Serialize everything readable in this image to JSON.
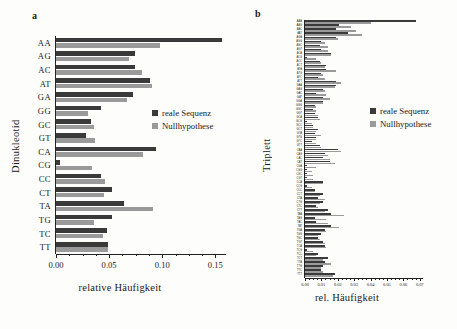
{
  "figure": {
    "legend_labels": {
      "real": "reale Sequenz",
      "null": "Nullhypothese"
    },
    "colors": {
      "real": "#3a3a3a",
      "null": "#9a9a9a",
      "axis": "#222222",
      "background": "#fdfdfb"
    }
  },
  "panel_a": {
    "letter": "a",
    "ylabel": "Dinukleotid",
    "xlabel": "relative Häufigkeit"
  },
  "panel_b": {
    "letter": "b",
    "ylabel": "Triplett",
    "xlabel": "rel. Häufigkeit"
  },
  "chart_data": [
    {
      "type": "bar",
      "orientation": "horizontal",
      "panel": "a",
      "title": "",
      "xlabel": "relative Häufigkeit",
      "ylabel": "Dinukleotid",
      "xlim": [
        0.0,
        0.16
      ],
      "xticks": [
        0.0,
        0.05,
        0.1,
        0.15
      ],
      "xticklabels": [
        "0.00",
        "0.05",
        "0.10",
        "0.15"
      ],
      "grid": false,
      "legend_position": "center-right",
      "categories": [
        "AA",
        "AG",
        "AC",
        "AT",
        "GA",
        "GG",
        "GC",
        "GT",
        "CA",
        "CG",
        "CC",
        "CT",
        "TA",
        "TG",
        "TC",
        "TT"
      ],
      "series": [
        {
          "name": "reale Sequenz",
          "color": "#3a3a3a",
          "values": [
            0.156,
            0.074,
            0.074,
            0.088,
            0.072,
            0.042,
            0.033,
            0.028,
            0.094,
            0.004,
            0.042,
            0.053,
            0.064,
            0.053,
            0.048,
            0.049
          ]
        },
        {
          "name": "Nullhypothese",
          "color": "#9a9a9a",
          "values": [
            0.098,
            0.069,
            0.081,
            0.09,
            0.067,
            0.03,
            0.036,
            0.037,
            0.082,
            0.034,
            0.046,
            0.045,
            0.091,
            0.036,
            0.044,
            0.049
          ]
        }
      ]
    },
    {
      "type": "bar",
      "orientation": "horizontal",
      "panel": "b",
      "title": "",
      "xlabel": "rel. Häufigkeit",
      "ylabel": "Triplett",
      "xlim": [
        0.0,
        0.072
      ],
      "xticks": [
        0.0,
        0.01,
        0.02,
        0.03,
        0.04,
        0.05,
        0.06,
        0.07
      ],
      "xticklabels": [
        "0.00",
        "0.01",
        "0.02",
        "0.03",
        "0.04",
        "0.05",
        "0.06",
        "0.07"
      ],
      "grid": false,
      "legend_position": "center-right",
      "categories": [
        "AAA",
        "AAG",
        "AAC",
        "AAT",
        "AGA",
        "AGG",
        "AGC",
        "AGT",
        "ACA",
        "ACG",
        "ACC",
        "ACT",
        "ATA",
        "ATG",
        "ATC",
        "ATT",
        "GAA",
        "GAG",
        "GAC",
        "GAT",
        "GGA",
        "GGG",
        "GGC",
        "GGT",
        "GCA",
        "GCG",
        "GCC",
        "GCT",
        "GTA",
        "GTG",
        "GTC",
        "GTT",
        "CAA",
        "CAG",
        "CAC",
        "CAT",
        "CGA",
        "CGG",
        "CGC",
        "CGT",
        "CCA",
        "CCG",
        "CCC",
        "CCT",
        "CTA",
        "CTG",
        "CTC",
        "CTT",
        "TAA",
        "TAG",
        "TAC",
        "TAT",
        "TGA",
        "TGG",
        "TGC",
        "TGT",
        "TCA",
        "TCG",
        "TCC",
        "TCT",
        "TTA",
        "TTG",
        "TTC",
        "TTT"
      ],
      "series": [
        {
          "name": "reale Sequenz",
          "color": "#3a3a3a",
          "values": [
            0.068,
            0.021,
            0.019,
            0.026,
            0.019,
            0.01,
            0.009,
            0.01,
            0.016,
            0.001,
            0.009,
            0.013,
            0.013,
            0.01,
            0.008,
            0.019,
            0.019,
            0.011,
            0.007,
            0.011,
            0.011,
            0.006,
            0.005,
            0.006,
            0.008,
            0.001,
            0.005,
            0.008,
            0.006,
            0.007,
            0.004,
            0.009,
            0.02,
            0.012,
            0.011,
            0.015,
            0.001,
            0.001,
            0.001,
            0.001,
            0.011,
            0.001,
            0.006,
            0.011,
            0.008,
            0.011,
            0.007,
            0.014,
            0.016,
            0.006,
            0.007,
            0.016,
            0.012,
            0.01,
            0.008,
            0.011,
            0.012,
            0.001,
            0.008,
            0.014,
            0.012,
            0.011,
            0.01,
            0.018
          ]
        },
        {
          "name": "Nullhypothese",
          "color": "#9a9a9a",
          "values": [
            0.04,
            0.028,
            0.031,
            0.035,
            0.02,
            0.012,
            0.014,
            0.014,
            0.016,
            0.007,
            0.01,
            0.012,
            0.019,
            0.011,
            0.012,
            0.022,
            0.018,
            0.012,
            0.013,
            0.015,
            0.011,
            0.007,
            0.007,
            0.008,
            0.009,
            0.004,
            0.005,
            0.007,
            0.01,
            0.007,
            0.007,
            0.01,
            0.022,
            0.014,
            0.015,
            0.018,
            0.007,
            0.004,
            0.005,
            0.005,
            0.011,
            0.004,
            0.006,
            0.009,
            0.012,
            0.009,
            0.008,
            0.012,
            0.024,
            0.013,
            0.014,
            0.021,
            0.013,
            0.008,
            0.009,
            0.012,
            0.013,
            0.005,
            0.007,
            0.011,
            0.016,
            0.01,
            0.011,
            0.017
          ]
        }
      ]
    }
  ]
}
